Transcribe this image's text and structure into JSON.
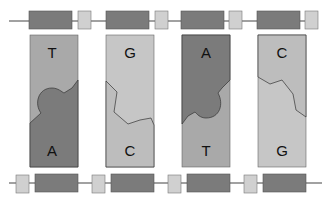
{
  "colors": {
    "dark": "#7b7b7b",
    "light": "#c6c6c6",
    "mid": "#a9a9a9",
    "line": "#444444"
  },
  "pairs": [
    {
      "top": "T",
      "bottom": "A"
    },
    {
      "top": "G",
      "bottom": "C"
    },
    {
      "top": "A",
      "bottom": "T"
    },
    {
      "top": "C",
      "bottom": "G"
    }
  ]
}
